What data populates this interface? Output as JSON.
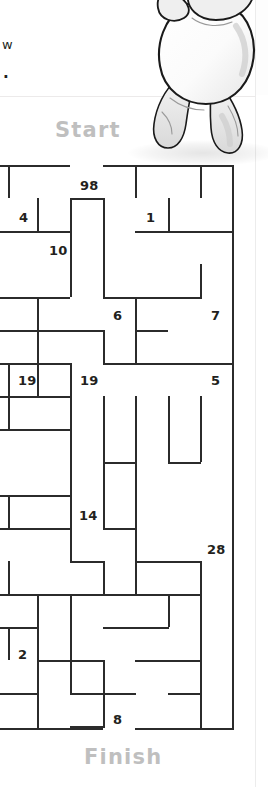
{
  "page": {
    "top_text_fragments": [
      "w",
      "."
    ],
    "start_label": "Start",
    "finish_label": "Finish",
    "ink_color": "#2b2b2b",
    "label_color": "#bfbfbf",
    "text_color": "#231f20"
  },
  "illustration": {
    "name": "cartoon-hippo-character",
    "description": "grey-and-white cartoon hippo standing, line art"
  },
  "maze": {
    "cell_size": 33,
    "cols": 8,
    "rows": 17,
    "origin_x": 4,
    "origin_y": 5,
    "start_gap": {
      "col": 2
    },
    "finish_gap": {
      "col": 3
    },
    "numbers": [
      {
        "text": "98",
        "x": 80,
        "y": 18
      },
      {
        "text": "4",
        "x": 19,
        "y": 50
      },
      {
        "text": "1",
        "x": 146,
        "y": 50
      },
      {
        "text": "10",
        "x": 49,
        "y": 83
      },
      {
        "text": "6",
        "x": 113,
        "y": 148
      },
      {
        "text": "7",
        "x": 211,
        "y": 148
      },
      {
        "text": "19",
        "x": 18,
        "y": 213
      },
      {
        "text": "19",
        "x": 80,
        "y": 213
      },
      {
        "text": "5",
        "x": 211,
        "y": 213
      },
      {
        "text": "14",
        "x": 79,
        "y": 348
      },
      {
        "text": "28",
        "x": 207,
        "y": 382
      },
      {
        "text": "2",
        "x": 18,
        "y": 487
      },
      {
        "text": "8",
        "x": 113,
        "y": 552
      }
    ],
    "walls_h": [
      {
        "x": 0,
        "y": 5,
        "w": 70
      },
      {
        "x": 103,
        "y": 5,
        "w": 131
      },
      {
        "x": 0,
        "y": 71,
        "w": 37
      },
      {
        "x": 70,
        "y": 38,
        "w": 33
      },
      {
        "x": 37,
        "y": 71,
        "w": 33
      },
      {
        "x": 135,
        "y": 71,
        "w": 99
      },
      {
        "x": 0,
        "y": 137,
        "w": 37
      },
      {
        "x": 103,
        "y": 137,
        "w": 99
      },
      {
        "x": 0,
        "y": 170,
        "w": 37
      },
      {
        "x": 37,
        "y": 137,
        "w": 33
      },
      {
        "x": 37,
        "y": 137,
        "w": 1
      },
      {
        "x": 37,
        "y": 137,
        "w": 0
      },
      {
        "x": 37,
        "y": 138,
        "w": 0
      },
      {
        "x": 0,
        "y": 203,
        "w": 37
      },
      {
        "x": 37,
        "y": 170,
        "w": 33
      },
      {
        "x": 70,
        "y": 170,
        "w": 33
      },
      {
        "x": 135,
        "y": 170,
        "w": 33
      },
      {
        "x": 37,
        "y": 203,
        "w": 33
      },
      {
        "x": 103,
        "y": 203,
        "w": 131
      },
      {
        "x": 0,
        "y": 236,
        "w": 70
      },
      {
        "x": 0,
        "y": 269,
        "w": 70
      },
      {
        "x": 0,
        "y": 335,
        "w": 70
      },
      {
        "x": 0,
        "y": 368,
        "w": 70
      },
      {
        "x": 103,
        "y": 302,
        "w": 33
      },
      {
        "x": 168,
        "y": 302,
        "w": 33
      },
      {
        "x": 103,
        "y": 368,
        "w": 33
      },
      {
        "x": 0,
        "y": 434,
        "w": 37
      },
      {
        "x": 70,
        "y": 401,
        "w": 33
      },
      {
        "x": 135,
        "y": 401,
        "w": 66
      },
      {
        "x": 37,
        "y": 434,
        "w": 66
      },
      {
        "x": 103,
        "y": 434,
        "w": 99
      },
      {
        "x": 0,
        "y": 467,
        "w": 37
      },
      {
        "x": 103,
        "y": 467,
        "w": 66
      },
      {
        "x": 37,
        "y": 500,
        "w": 66
      },
      {
        "x": 135,
        "y": 500,
        "w": 66
      },
      {
        "x": 103,
        "y": 533,
        "w": 33
      },
      {
        "x": 0,
        "y": 533,
        "w": 37
      },
      {
        "x": 70,
        "y": 533,
        "w": 33
      },
      {
        "x": 70,
        "y": 566,
        "w": 33
      },
      {
        "x": 168,
        "y": 533,
        "w": 33
      },
      {
        "x": 0,
        "y": 568,
        "w": 103
      },
      {
        "x": 135,
        "y": 568,
        "w": 99
      }
    ],
    "walls_v": [
      {
        "x": 8,
        "y": 5,
        "h": 33
      },
      {
        "x": 37,
        "y": 38,
        "h": 33
      },
      {
        "x": 70,
        "y": 38,
        "h": 99
      },
      {
        "x": 103,
        "y": 38,
        "h": 99
      },
      {
        "x": 135,
        "y": 5,
        "h": 33
      },
      {
        "x": 168,
        "y": 38,
        "h": 33
      },
      {
        "x": 200,
        "y": 5,
        "h": 33
      },
      {
        "x": 232,
        "y": 5,
        "h": 563
      },
      {
        "x": 200,
        "y": 104,
        "h": 33
      },
      {
        "x": 37,
        "y": 137,
        "h": 66
      },
      {
        "x": 135,
        "y": 137,
        "h": 66
      },
      {
        "x": 103,
        "y": 170,
        "h": 33
      },
      {
        "x": 8,
        "y": 203,
        "h": 33
      },
      {
        "x": 37,
        "y": 203,
        "h": 33
      },
      {
        "x": 70,
        "y": 203,
        "h": 198
      },
      {
        "x": 103,
        "y": 236,
        "h": 99
      },
      {
        "x": 135,
        "y": 236,
        "h": 198
      },
      {
        "x": 168,
        "y": 236,
        "h": 66
      },
      {
        "x": 200,
        "y": 236,
        "h": 66
      },
      {
        "x": 8,
        "y": 236,
        "h": 33
      },
      {
        "x": 8,
        "y": 335,
        "h": 33
      },
      {
        "x": 70,
        "y": 434,
        "h": 33
      },
      {
        "x": 8,
        "y": 401,
        "h": 33
      },
      {
        "x": 8,
        "y": 467,
        "h": 33
      },
      {
        "x": 37,
        "y": 434,
        "h": 134
      },
      {
        "x": 103,
        "y": 401,
        "h": 33
      },
      {
        "x": 168,
        "y": 434,
        "h": 33
      },
      {
        "x": 70,
        "y": 467,
        "h": 66
      },
      {
        "x": 103,
        "y": 500,
        "h": 68
      },
      {
        "x": 200,
        "y": 401,
        "h": 167
      },
      {
        "x": 103,
        "y": 335,
        "h": 33
      }
    ]
  }
}
